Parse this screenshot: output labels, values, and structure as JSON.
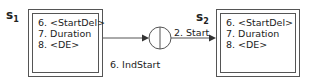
{
  "diagram": {
    "states": [
      {
        "id": "s1",
        "name": "s",
        "subscript": "1",
        "lines": [
          "6. <StartDel>",
          "7. Duration",
          "8. <DE>"
        ]
      },
      {
        "id": "s2",
        "name": "s",
        "subscript": "2",
        "lines": [
          "6. <StartDel>",
          "7. Duration",
          "8. <DE>"
        ]
      }
    ],
    "junction": {
      "shape": "circle-with-vertical-bar"
    },
    "edges": [
      {
        "from": "s1",
        "to": "junction",
        "label": "6. IndStart"
      },
      {
        "from": "junction",
        "to": "s2",
        "label": "2. Start"
      }
    ],
    "colors": {
      "stroke": "#555555",
      "text": "#222222",
      "background": "#ffffff"
    }
  }
}
